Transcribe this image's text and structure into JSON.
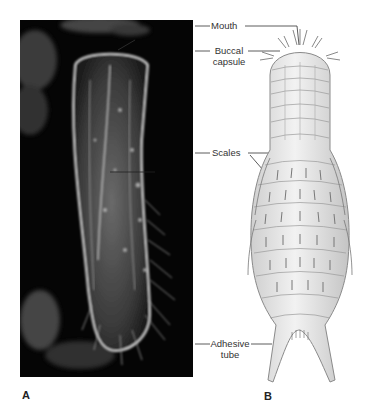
{
  "figure": {
    "panels": [
      {
        "id": "A",
        "label": "A",
        "type": "photomicrograph"
      },
      {
        "id": "B",
        "label": "B",
        "type": "illustration"
      }
    ],
    "annotations": [
      {
        "key": "mouth",
        "text": "Mouth"
      },
      {
        "key": "buccal_line1",
        "text": "Buccal"
      },
      {
        "key": "buccal_line2",
        "text": "capsule"
      },
      {
        "key": "scales",
        "text": "Scales"
      },
      {
        "key": "adhesive_line1",
        "text": "Adhesive"
      },
      {
        "key": "adhesive_line2",
        "text": "tube"
      }
    ]
  },
  "colors": {
    "photo_bg": "#050505",
    "leader_line": "#333333",
    "drawing_fill": "#e6e6e6",
    "drawing_stroke": "#8a8a8a"
  }
}
